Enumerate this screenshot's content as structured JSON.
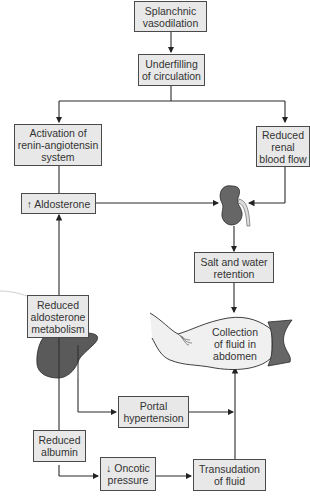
{
  "diagram": {
    "nodes": {
      "splanchnic": {
        "lines": [
          "Splanchnic",
          "vasodilation"
        ]
      },
      "underfilling": {
        "lines": [
          "Underfilling",
          "of circulation"
        ]
      },
      "raas": {
        "lines": [
          "Activation of",
          "renin-angiotensin",
          "system"
        ]
      },
      "renal": {
        "lines": [
          "Reduced",
          "renal",
          "blood flow"
        ]
      },
      "aldosterone": {
        "lines": [
          "↑ Aldosterone"
        ]
      },
      "salt": {
        "lines": [
          "Salt and water",
          "retention"
        ]
      },
      "aldo_metab": {
        "lines": [
          "Reduced",
          "aldosterone",
          "metabolism"
        ]
      },
      "collection": {
        "lines": [
          "Collection",
          "of fluid in",
          "abdomen"
        ]
      },
      "portal": {
        "lines": [
          "Portal",
          "hypertension"
        ]
      },
      "albumin": {
        "lines": [
          "Reduced",
          "albumin"
        ]
      },
      "oncotic": {
        "lines": [
          "↓ Oncotic",
          "pressure"
        ]
      },
      "transudation": {
        "lines": [
          "Transudation",
          "of fluid"
        ]
      }
    },
    "illustrations": [
      "kidney-icon",
      "liver-icon",
      "abdomen-icon"
    ],
    "edges": [
      [
        "Splanchnic vasodilation",
        "Underfilling of circulation"
      ],
      [
        "Underfilling of circulation",
        "Activation of renin-angiotensin system"
      ],
      [
        "Underfilling of circulation",
        "Reduced renal blood flow"
      ],
      [
        "Activation of renin-angiotensin system",
        "↑ Aldosterone"
      ],
      [
        "↑ Aldosterone",
        "Kidney"
      ],
      [
        "Reduced renal blood flow",
        "Kidney"
      ],
      [
        "Kidney",
        "Salt and water retention"
      ],
      [
        "Salt and water retention",
        "Collection of fluid in abdomen"
      ],
      [
        "Reduced aldosterone metabolism",
        "↑ Aldosterone"
      ],
      [
        "Liver",
        "Reduced aldosterone metabolism"
      ],
      [
        "Liver",
        "Portal hypertension"
      ],
      [
        "Liver",
        "Reduced albumin"
      ],
      [
        "Portal hypertension",
        "Collection of fluid in abdomen"
      ],
      [
        "Reduced albumin",
        "↓ Oncotic pressure"
      ],
      [
        "↓ Oncotic pressure",
        "Transudation of fluid"
      ],
      [
        "Transudation of fluid",
        "Collection of fluid in abdomen"
      ]
    ],
    "colors": {
      "box_fill": "#e8e8e8",
      "box_border": "#4a4a4a",
      "organ_fill": "#555555",
      "abdomen_fill": "#f2f2f2"
    }
  }
}
